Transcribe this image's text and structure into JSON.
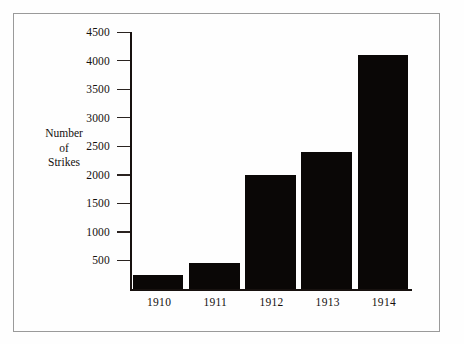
{
  "chart_data": {
    "type": "bar",
    "title": "",
    "subtitle": "",
    "xlabel": "",
    "ylabel": "Number of Strikes",
    "ylabel_lines": [
      "Number",
      "of",
      "Strikes"
    ],
    "categories": [
      "1910",
      "1911",
      "1912",
      "1913",
      "1914"
    ],
    "values": [
      250,
      450,
      2000,
      2400,
      4100
    ],
    "ylim": [
      0,
      4500
    ],
    "ytick_values": [
      500,
      1000,
      1500,
      2000,
      2500,
      3000,
      3500,
      4000,
      4500
    ],
    "ytick_labels": [
      "500",
      "1000",
      "1500",
      "2000",
      "2500",
      "3000",
      "3500",
      "4000",
      "4500"
    ],
    "grid": false,
    "legend": false,
    "legend_position": "none",
    "bar_color": "#0a0706",
    "axis_color": "#17110f",
    "frame_color": "#9a9a9a",
    "background_color": "#fefefe"
  }
}
